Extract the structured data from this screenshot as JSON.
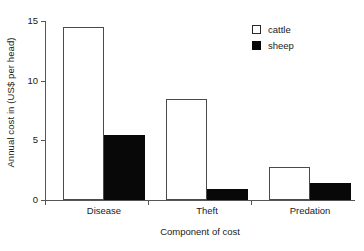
{
  "chart_data": {
    "type": "bar",
    "title": "",
    "subtitle": "",
    "xlabel": "Component of cost",
    "ylabel": "Annual cost in (US$ per head)",
    "categories": [
      "Disease",
      "Theft",
      "Predation"
    ],
    "series": [
      {
        "name": "cattle",
        "values": [
          14.5,
          8.45,
          2.8
        ],
        "color": "#ffffff",
        "edge_color": "#4a4a4a"
      },
      {
        "name": "sheep",
        "values": [
          5.45,
          0.95,
          1.45
        ],
        "color": "#080808",
        "edge_color": "#080808"
      }
    ],
    "ylim": [
      0,
      15
    ],
    "yticks": [
      0,
      5,
      10,
      15
    ],
    "ytick_labels": [
      "0",
      "5",
      "10",
      "15"
    ],
    "grid": false,
    "legend_position": "top-right",
    "legend_entries": [
      "cattle",
      "sheep"
    ]
  },
  "axes": {
    "y_title": "Annual cost in (US$ per head)",
    "x_title": "Component of cost",
    "y_tick_0": "0",
    "y_tick_1": "5",
    "y_tick_2": "10",
    "y_tick_3": "15"
  },
  "legend": {
    "cattle_label": "cattle",
    "sheep_label": "sheep"
  },
  "categories": {
    "c0": "Disease",
    "c1": "Theft",
    "c2": "Predation"
  }
}
